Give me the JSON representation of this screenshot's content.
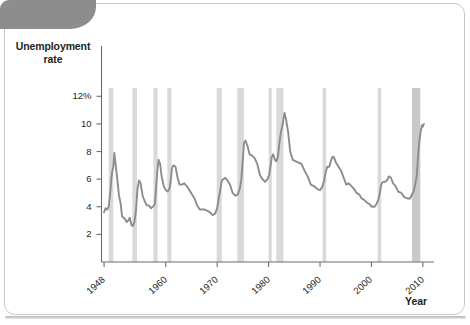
{
  "figure": {
    "corner_tab_color": "#8d8d8d",
    "frame_color": "#c8c8c8",
    "background": "#ffffff"
  },
  "chart_data": {
    "type": "line",
    "title": "",
    "subtitle": "",
    "xlabel": "Year",
    "ylabel": "Unemployment rate",
    "ylabel_lines": [
      "Unemployment",
      "rate"
    ],
    "xlim": [
      1947.5,
      2011.0
    ],
    "ylim": [
      0,
      12.6
    ],
    "grid": false,
    "legend": null,
    "line_color": "#8c8c8c",
    "recession_band_color": "#d9d9d9",
    "last_recession_band_color": "#c9c9c9",
    "ytick_labels": [
      "12%",
      "10",
      "8",
      "6",
      "4",
      "2"
    ],
    "ytick_values": [
      12,
      10,
      8,
      6,
      4,
      2
    ],
    "xtick_labels": [
      "1948",
      "1960",
      "1970",
      "1980",
      "1990",
      "2000",
      "2010"
    ],
    "xtick_values": [
      1948,
      1960,
      1970,
      1980,
      1990,
      2000,
      2010
    ],
    "series": [
      {
        "name": "Unemployment rate",
        "x": [
          1948.0,
          1948.3,
          1948.6,
          1948.9,
          1949.0,
          1949.2,
          1949.4,
          1949.6,
          1949.8,
          1950.0,
          1950.3,
          1950.6,
          1950.9,
          1951.2,
          1951.5,
          1951.8,
          1952.1,
          1952.4,
          1952.7,
          1953.0,
          1953.3,
          1953.6,
          1953.9,
          1954.2,
          1954.5,
          1954.8,
          1955.1,
          1955.5,
          1955.9,
          1956.3,
          1956.7,
          1957.1,
          1957.5,
          1957.9,
          1958.1,
          1958.4,
          1958.6,
          1958.9,
          1959.2,
          1959.6,
          1960.0,
          1960.4,
          1960.8,
          1961.0,
          1961.2,
          1961.5,
          1961.9,
          1962.3,
          1962.7,
          1963.1,
          1963.6,
          1964.1,
          1964.6,
          1965.1,
          1965.6,
          1966.1,
          1966.6,
          1967.1,
          1967.6,
          1968.1,
          1968.6,
          1969.1,
          1969.6,
          1970.0,
          1970.3,
          1970.6,
          1970.9,
          1971.2,
          1971.6,
          1972.0,
          1972.5,
          1973.0,
          1973.5,
          1974.0,
          1974.4,
          1974.7,
          1975.0,
          1975.2,
          1975.5,
          1975.9,
          1976.3,
          1976.8,
          1977.3,
          1977.8,
          1978.3,
          1978.8,
          1979.3,
          1979.8,
          1980.1,
          1980.4,
          1980.6,
          1980.9,
          1981.2,
          1981.5,
          1981.8,
          1982.1,
          1982.4,
          1982.7,
          1982.9,
          1983.1,
          1983.4,
          1983.8,
          1984.2,
          1984.7,
          1985.2,
          1985.8,
          1986.4,
          1987.0,
          1987.6,
          1988.2,
          1988.8,
          1989.4,
          1990.0,
          1990.4,
          1990.8,
          1991.1,
          1991.4,
          1991.8,
          1992.1,
          1992.4,
          1992.7,
          1993.1,
          1993.6,
          1994.1,
          1994.6,
          1995.1,
          1995.6,
          1996.1,
          1996.6,
          1997.1,
          1997.6,
          1998.1,
          1998.6,
          1999.1,
          1999.6,
          2000.1,
          2000.6,
          2001.0,
          2001.3,
          2001.6,
          2001.9,
          2002.2,
          2002.6,
          2003.0,
          2003.4,
          2003.8,
          2004.2,
          2004.7,
          2005.2,
          2005.8,
          2006.4,
          2007.0,
          2007.5,
          2007.9,
          2008.2,
          2008.5,
          2008.8,
          2009.0,
          2009.2,
          2009.4,
          2009.6,
          2009.8,
          2010.0,
          2010.2
        ],
        "y": [
          3.6,
          3.9,
          3.8,
          4.0,
          4.3,
          5.0,
          6.0,
          6.6,
          6.9,
          7.9,
          6.9,
          5.9,
          4.8,
          4.3,
          3.3,
          3.2,
          3.1,
          2.9,
          3.0,
          3.2,
          2.7,
          2.6,
          2.9,
          3.7,
          5.3,
          5.9,
          5.7,
          4.8,
          4.4,
          4.1,
          4.1,
          3.9,
          4.0,
          4.2,
          5.3,
          6.8,
          7.4,
          7.1,
          6.2,
          5.5,
          5.2,
          5.1,
          5.4,
          6.0,
          6.8,
          7.0,
          6.9,
          6.1,
          5.6,
          5.6,
          5.7,
          5.5,
          5.2,
          4.9,
          4.6,
          4.1,
          3.8,
          3.8,
          3.8,
          3.7,
          3.6,
          3.4,
          3.5,
          3.9,
          4.6,
          5.2,
          5.9,
          6.0,
          6.1,
          5.9,
          5.6,
          5.0,
          4.8,
          4.9,
          5.3,
          6.0,
          7.5,
          8.6,
          8.8,
          8.4,
          7.8,
          7.7,
          7.5,
          7.1,
          6.3,
          6.0,
          5.8,
          6.0,
          6.3,
          7.0,
          7.6,
          7.8,
          7.4,
          7.3,
          7.6,
          8.6,
          9.4,
          9.9,
          10.4,
          10.8,
          10.3,
          9.4,
          8.0,
          7.4,
          7.3,
          7.2,
          7.1,
          6.6,
          6.2,
          5.6,
          5.5,
          5.3,
          5.2,
          5.4,
          5.9,
          6.5,
          6.9,
          6.9,
          7.3,
          7.6,
          7.6,
          7.2,
          6.9,
          6.6,
          6.1,
          5.6,
          5.7,
          5.5,
          5.3,
          5.0,
          4.9,
          4.6,
          4.5,
          4.3,
          4.2,
          4.0,
          4.0,
          4.2,
          4.5,
          4.9,
          5.6,
          5.8,
          5.8,
          5.9,
          6.2,
          6.1,
          5.7,
          5.5,
          5.1,
          5.0,
          4.7,
          4.6,
          4.6,
          4.9,
          5.1,
          5.6,
          6.2,
          7.3,
          8.3,
          9.0,
          9.5,
          9.9,
          9.8,
          10.0
        ],
        "color": "#8c8c8c"
      }
    ],
    "recession_bands": [
      {
        "start": 1948.9,
        "end": 1949.8,
        "label": "1948-49 recession"
      },
      {
        "start": 1953.5,
        "end": 1954.4,
        "label": "1953-54 recession"
      },
      {
        "start": 1957.6,
        "end": 1958.4,
        "label": "1957-58 recession"
      },
      {
        "start": 1960.3,
        "end": 1961.1,
        "label": "1960-61 recession"
      },
      {
        "start": 1969.9,
        "end": 1970.9,
        "label": "1969-70 recession"
      },
      {
        "start": 1973.9,
        "end": 1975.2,
        "label": "1973-75 recession"
      },
      {
        "start": 1980.0,
        "end": 1980.6,
        "label": "1980 recession"
      },
      {
        "start": 1981.5,
        "end": 1982.9,
        "label": "1981-82 recession"
      },
      {
        "start": 1990.5,
        "end": 1991.2,
        "label": "1990-91 recession"
      },
      {
        "start": 2001.2,
        "end": 2001.9,
        "label": "2001 recession"
      },
      {
        "start": 2007.9,
        "end": 2009.5,
        "label": "2007-09 recession"
      }
    ],
    "annotation": "Shaded vertical bands mark U.S. recessions"
  }
}
